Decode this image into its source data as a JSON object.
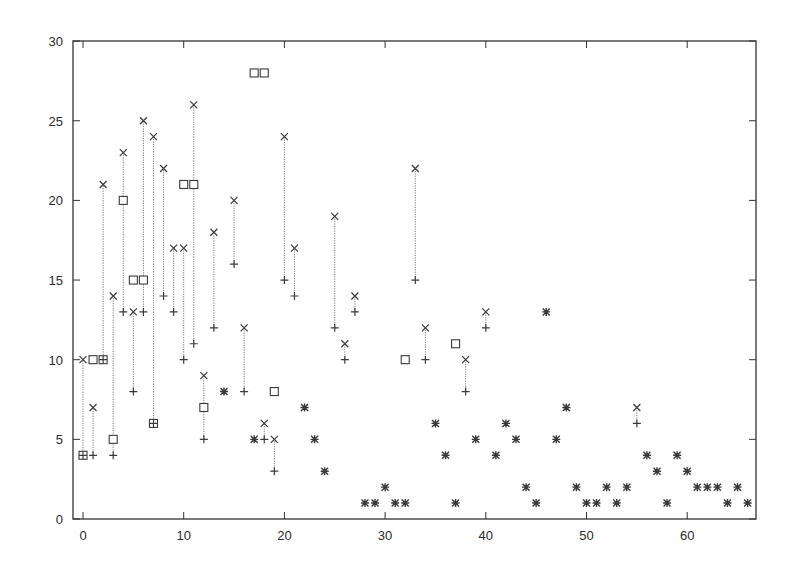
{
  "chart_data": {
    "type": "scatter",
    "title": "",
    "xlabel": "",
    "ylabel": "",
    "xlim": [
      -1,
      67
    ],
    "ylim": [
      0,
      30
    ],
    "grid": false,
    "legend": null,
    "x_ticks": [
      0,
      10,
      20,
      30,
      40,
      50,
      60
    ],
    "y_ticks": [
      0,
      5,
      10,
      15,
      20,
      25,
      30
    ],
    "x": [
      0,
      1,
      2,
      3,
      4,
      5,
      6,
      7,
      8,
      9,
      10,
      11,
      12,
      13,
      14,
      15,
      16,
      17,
      18,
      19,
      20,
      21,
      22,
      23,
      24,
      25,
      26,
      27,
      28,
      29,
      30,
      31,
      32,
      33,
      34,
      35,
      36,
      37,
      38,
      39,
      40,
      41,
      42,
      43,
      44,
      45,
      46,
      47,
      48,
      49,
      50,
      51,
      52,
      53,
      54,
      55,
      56,
      57,
      58,
      59,
      60,
      61,
      62,
      63,
      64,
      65,
      66
    ],
    "series": [
      {
        "name": "lower",
        "marker": "plus",
        "values": [
          4,
          4,
          10,
          4,
          13,
          8,
          13,
          6,
          14,
          13,
          10,
          11,
          5,
          12,
          8,
          16,
          8,
          5,
          5,
          3,
          15,
          14,
          7,
          5,
          3,
          12,
          10,
          13,
          1,
          1,
          2,
          1,
          1,
          15,
          10,
          6,
          4,
          1,
          8,
          5,
          12,
          4,
          6,
          5,
          2,
          1,
          13,
          5,
          7,
          2,
          1,
          1,
          2,
          1,
          2,
          6,
          4,
          3,
          1,
          4,
          3,
          2,
          2,
          2,
          1,
          2,
          1
        ]
      },
      {
        "name": "upper",
        "marker": "cross",
        "values": [
          10,
          7,
          21,
          14,
          23,
          13,
          25,
          24,
          22,
          17,
          17,
          26,
          9,
          18,
          8,
          20,
          12,
          5,
          6,
          5,
          24,
          17,
          7,
          5,
          3,
          19,
          11,
          14,
          1,
          1,
          2,
          1,
          1,
          22,
          12,
          6,
          4,
          1,
          10,
          5,
          13,
          4,
          6,
          5,
          2,
          1,
          13,
          5,
          7,
          2,
          1,
          1,
          2,
          1,
          2,
          7,
          4,
          3,
          1,
          4,
          3,
          2,
          2,
          2,
          1,
          2,
          1
        ]
      },
      {
        "name": "square",
        "marker": "square",
        "values": [
          4,
          10,
          10,
          5,
          20,
          15,
          15,
          6,
          null,
          null,
          21,
          21,
          7,
          null,
          null,
          null,
          null,
          28,
          28,
          8,
          null,
          null,
          null,
          null,
          null,
          null,
          null,
          null,
          null,
          null,
          null,
          null,
          10,
          null,
          null,
          null,
          null,
          11,
          null,
          null,
          null,
          null,
          null,
          null,
          null,
          null,
          null,
          null,
          null,
          null,
          null,
          null,
          null,
          null,
          null,
          null,
          null,
          null,
          null,
          null,
          null,
          null,
          null,
          null,
          null,
          null,
          null
        ]
      }
    ],
    "range_lines": "dotted vertical line connecting lower (+) to upper (x) at each x",
    "style": {
      "axis_color": "#333333",
      "marker_color": "#3a3a3a",
      "line_color": "#7a7a7a"
    }
  }
}
